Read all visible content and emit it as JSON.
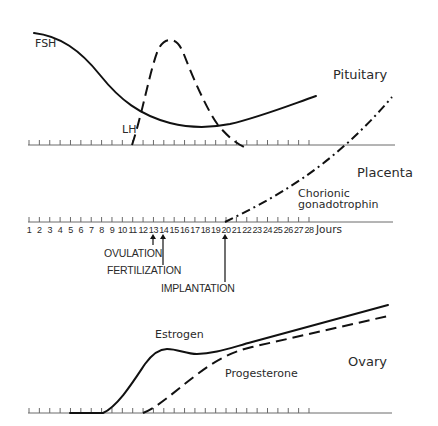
{
  "figure": {
    "pituitary": {
      "label": "Pituitary",
      "fsh_label": "FSH",
      "lh_label": "LH"
    },
    "placenta": {
      "label": "Placenta",
      "hcg_label_line1": "Chorionic",
      "hcg_label_line2": "gonadotrophin"
    },
    "ovary": {
      "label": "Ovary",
      "estrogen_label": "Estrogen",
      "progesterone_label": "Progesterone"
    },
    "axis": {
      "days": [
        1,
        2,
        3,
        4,
        5,
        6,
        7,
        8,
        9,
        10,
        11,
        12,
        13,
        14,
        15,
        16,
        17,
        18,
        19,
        20,
        21,
        22,
        23,
        24,
        25,
        26,
        27,
        28
      ],
      "unit": "Jours"
    },
    "events": {
      "ovulation": {
        "label": "OVULATION",
        "day": 13
      },
      "fertilization": {
        "label": "FERTILIZATION",
        "day": 14
      },
      "implantation": {
        "label": "IMPLANTATION",
        "day": 20
      }
    }
  }
}
